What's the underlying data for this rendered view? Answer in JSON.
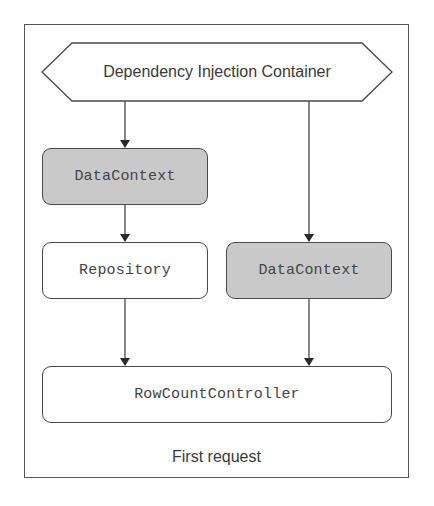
{
  "diagram": {
    "container": {
      "label": "Dependency Injection Container",
      "shape": "hexagon"
    },
    "nodes": [
      {
        "id": "datacontext-1",
        "label": "DataContext",
        "style": "shaded"
      },
      {
        "id": "repository",
        "label": "Repository",
        "style": "plain"
      },
      {
        "id": "datacontext-2",
        "label": "DataContext",
        "style": "shaded"
      },
      {
        "id": "rowcountcontroller",
        "label": "RowCountController",
        "style": "plain"
      }
    ],
    "edges": [
      {
        "from": "container",
        "to": "datacontext-1"
      },
      {
        "from": "datacontext-1",
        "to": "repository"
      },
      {
        "from": "container",
        "to": "datacontext-2"
      },
      {
        "from": "repository",
        "to": "rowcountcontroller"
      },
      {
        "from": "datacontext-2",
        "to": "rowcountcontroller"
      }
    ],
    "caption": "First request",
    "colors": {
      "shaded_fill": "#c9c9c9",
      "plain_fill": "#ffffff",
      "stroke": "#4a4a4a",
      "text": "#444444"
    }
  }
}
